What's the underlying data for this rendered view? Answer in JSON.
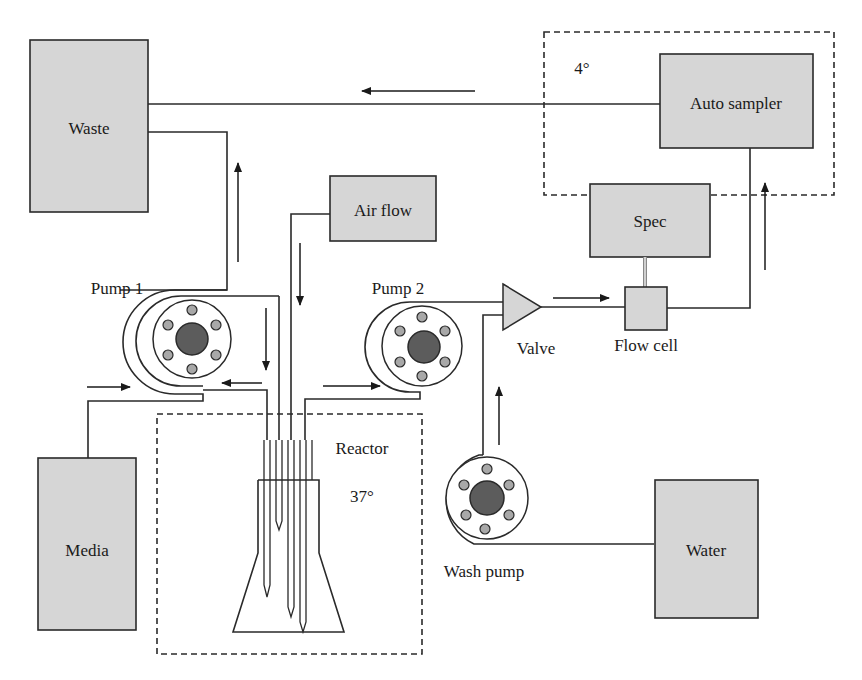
{
  "diagram": {
    "components": {
      "waste": {
        "label": "Waste"
      },
      "media": {
        "label": "Media"
      },
      "air_flow": {
        "label": "Air flow"
      },
      "auto_sampler": {
        "label": "Auto sampler"
      },
      "spec": {
        "label": "Spec"
      },
      "water": {
        "label": "Water"
      },
      "pump1": {
        "label": "Pump 1"
      },
      "pump2": {
        "label": "Pump 2"
      },
      "wash_pump": {
        "label": "Wash pump"
      },
      "valve": {
        "label": "Valve"
      },
      "flow_cell": {
        "label": "Flow cell"
      },
      "reactor": {
        "label": "Reactor",
        "temperature": "37°"
      },
      "cold_enclosure": {
        "temperature": "4°"
      }
    },
    "flows": [
      {
        "from": "Media",
        "to": "Pump 1",
        "direction": "right"
      },
      {
        "from": "Pump 1",
        "to": "Reactor",
        "direction": "down"
      },
      {
        "from": "Reactor",
        "to": "Pump 1",
        "direction": "left"
      },
      {
        "from": "Pump 1",
        "to": "Waste",
        "direction": "up"
      },
      {
        "from": "Air flow",
        "to": "Reactor",
        "direction": "down"
      },
      {
        "from": "Reactor",
        "to": "Pump 2",
        "direction": "right"
      },
      {
        "from": "Pump 2",
        "to": "Valve",
        "direction": "right"
      },
      {
        "from": "Wash pump",
        "to": "Valve",
        "direction": "up"
      },
      {
        "from": "Water",
        "to": "Wash pump",
        "direction": "left"
      },
      {
        "from": "Valve",
        "to": "Flow cell",
        "direction": "right"
      },
      {
        "from": "Flow cell",
        "to": "Auto sampler",
        "direction": "up"
      },
      {
        "from": "Auto sampler",
        "to": "Waste",
        "direction": "left"
      }
    ],
    "colors": {
      "box_fill": "#d6d6d6",
      "stroke": "#2a2a2a",
      "hub": "#5c5c5c",
      "roller": "#a8a8a8"
    }
  }
}
